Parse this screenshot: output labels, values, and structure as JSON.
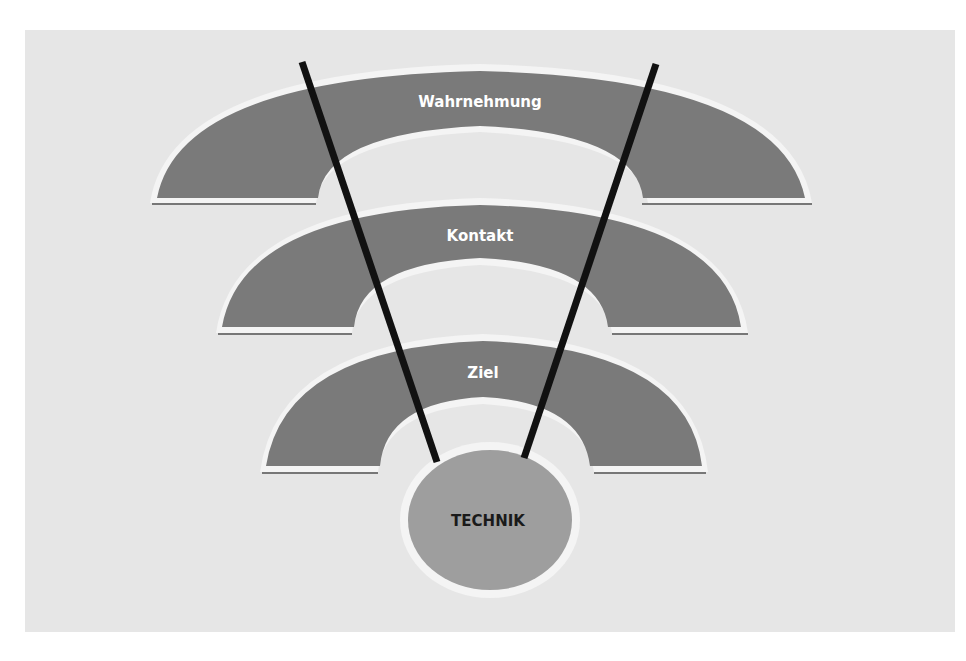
{
  "diagram": {
    "layers": [
      {
        "label": "Wahrnehmung"
      },
      {
        "label": "Kontakt"
      },
      {
        "label": "Ziel"
      }
    ],
    "core": {
      "label": "TECHNIK"
    },
    "colors": {
      "background_panel": "#e6e6e6",
      "arc_fill": "#7a7a7a",
      "arc_outline": "#f4f4f4",
      "core_fill": "#9e9e9e",
      "lines": "#111111"
    }
  }
}
